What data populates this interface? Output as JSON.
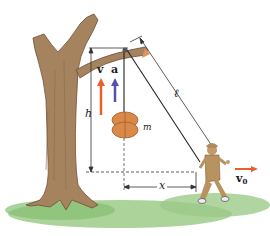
{
  "diagram": {
    "labels": {
      "velocity_box": "v",
      "acceleration_box": "a",
      "height": "h",
      "rope_length": "ℓ",
      "mass": "m",
      "horizontal_distance": "x",
      "boy_velocity": "v",
      "boy_velocity_subscript": "0"
    },
    "colors": {
      "velocity_arrow": "#e8612c",
      "acceleration_arrow": "#5a4fb0",
      "boy_velocity_arrow": "#e8612c",
      "tree_bark": "#a07e5c",
      "tree_dark": "#7a5a3e",
      "grass": "#8cc37a",
      "box": "#d9894a",
      "dimension_lines": "#333333"
    },
    "elements": [
      "tree",
      "pulley on branch",
      "box of mass m",
      "rope",
      "boy walking",
      "ground"
    ]
  }
}
